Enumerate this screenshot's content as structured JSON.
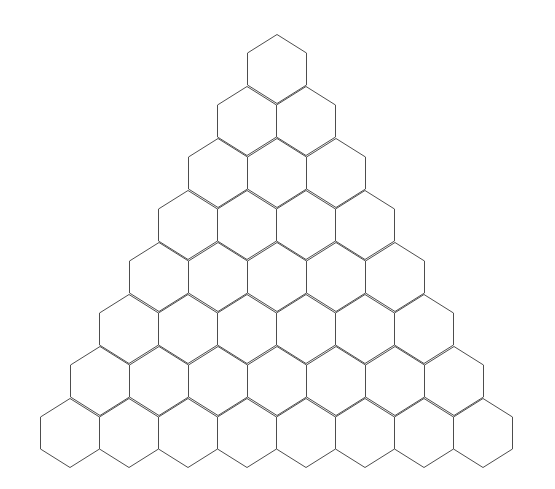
{
  "figure": {
    "name": "hexagonal-triangle-grid",
    "kind": "geometric-diagram",
    "background_color": "#ffffff",
    "stroke_color": "#4d4d4d",
    "fill_color": "#ffffff",
    "stroke_width": 1,
    "canvas": {
      "width": 555,
      "height": 489
    },
    "orientation": "pointy-top",
    "arrangement": "triangular-stack",
    "row_count": 8,
    "total_cells": 36,
    "cells_per_row": [
      1,
      2,
      3,
      4,
      5,
      6,
      7,
      8
    ],
    "geometry": {
      "hex_width": 59,
      "hex_height": 69,
      "row_step_y": 52,
      "col_step_x": 59,
      "apex_x": 277,
      "apex_y": 34,
      "bottom_y": 472,
      "left_x": 25,
      "right_x": 527,
      "side_vertical_length": 32,
      "slant_height": 18
    }
  },
  "chart_data": {
    "type": "table",
    "title": "",
    "xlabel": "",
    "ylabel": "",
    "categories": [
      "Row 1",
      "Row 2",
      "Row 3",
      "Row 4",
      "Row 5",
      "Row 6",
      "Row 7",
      "Row 8"
    ],
    "values": [
      1,
      2,
      3,
      4,
      5,
      6,
      7,
      8
    ],
    "series": [
      {
        "name": "Hexagons per row",
        "values": [
          1,
          2,
          3,
          4,
          5,
          6,
          7,
          8
        ]
      }
    ],
    "rows": [
      {
        "index": 1,
        "count": 1,
        "center_y": 69,
        "first_center_x": 277
      },
      {
        "index": 2,
        "count": 2,
        "center_y": 121,
        "first_center_x": 247
      },
      {
        "index": 3,
        "count": 3,
        "center_y": 173,
        "first_center_x": 218
      },
      {
        "index": 4,
        "count": 4,
        "center_y": 225,
        "first_center_x": 188
      },
      {
        "index": 5,
        "count": 5,
        "center_y": 277,
        "first_center_x": 159
      },
      {
        "index": 6,
        "count": 6,
        "center_y": 329,
        "first_center_x": 129
      },
      {
        "index": 7,
        "count": 7,
        "center_y": 381,
        "first_center_x": 100
      },
      {
        "index": 8,
        "count": 8,
        "center_y": 433,
        "first_center_x": 70
      }
    ]
  }
}
